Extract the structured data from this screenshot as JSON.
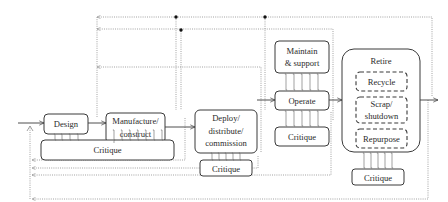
{
  "diagram": {
    "title": "",
    "stages": {
      "design": {
        "label": "Design"
      },
      "manufacture": {
        "line1": "Manufacture/",
        "line2": "construct"
      },
      "deploy": {
        "line1": "Deploy/",
        "line2": "distribute/",
        "line3": "commission"
      },
      "maintain": {
        "line1": "Maintain",
        "line2": "& support"
      },
      "operate": {
        "label": "Operate"
      },
      "retire": {
        "label": "Retire",
        "options": {
          "recycle": {
            "label": "Recycle"
          },
          "scrap": {
            "line1": "Scrap/",
            "line2": "shutdown"
          },
          "repurpose": {
            "label": "Repurpose"
          }
        }
      }
    },
    "critiques": {
      "c1": {
        "label": "Critique"
      },
      "c2": {
        "label": "Critique"
      },
      "c3": {
        "label": "Critique"
      },
      "c4": {
        "label": "Critique"
      }
    },
    "legend_notes": {
      "solid_arrows": "lifecycle flow",
      "double_arrows": "critique exchange",
      "dotted_arrows": "feedback loops"
    },
    "colors": {
      "stroke": "#3a3a3a",
      "feedback": "#8a8a8a",
      "junction": "#111111",
      "background": "#ffffff"
    }
  }
}
